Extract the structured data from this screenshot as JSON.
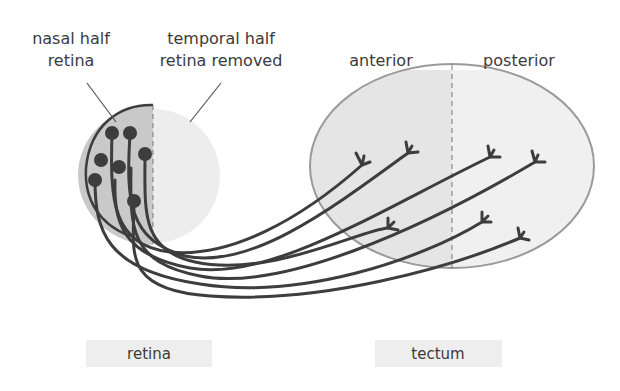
{
  "labels": {
    "nasal_line1": "nasal half",
    "nasal_line2": "retina",
    "temporal_line1": "temporal half",
    "temporal_line2": "retina removed",
    "anterior": "anterior",
    "posterior": "posterior",
    "retina_box": "retina",
    "tectum_box": "tectum"
  },
  "colors": {
    "nasal_fill": "#c9c9c9",
    "temporal_fill": "#ececec",
    "tectum_anterior_fill": "#e4e4e4",
    "tectum_posterior_fill": "#efefef",
    "outline": "#8e8e8e",
    "axon": "#3d3d3d",
    "label_box": "#eeeeee"
  }
}
